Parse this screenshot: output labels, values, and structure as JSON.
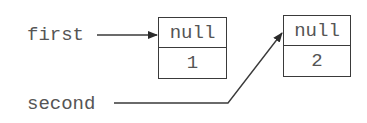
{
  "diagram": {
    "type": "linked-list-references",
    "variables": [
      {
        "name": "first",
        "points_to": 0
      },
      {
        "name": "second",
        "points_to": 1
      }
    ],
    "nodes": [
      {
        "next": "null",
        "value": "1"
      },
      {
        "next": "null",
        "value": "2"
      }
    ],
    "colors": {
      "text": "#555555",
      "stroke": "#3a3a3a",
      "background": "#ffffff"
    }
  }
}
